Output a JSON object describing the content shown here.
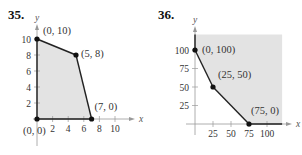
{
  "chart_data": [
    {
      "type": "area",
      "problem_number": "35.",
      "xlabel": "x",
      "ylabel": "y",
      "xlim": [
        0,
        11
      ],
      "ylim": [
        0,
        10.5
      ],
      "x_ticks": [
        2,
        4,
        6,
        8,
        10
      ],
      "y_ticks": [
        2,
        4,
        6,
        8,
        10
      ],
      "region": "bounded",
      "vertices": [
        {
          "x": 0,
          "y": 0,
          "label": "(0, 0)"
        },
        {
          "x": 0,
          "y": 10,
          "label": "(0, 10)"
        },
        {
          "x": 5,
          "y": 8,
          "label": "(5, 8)"
        },
        {
          "x": 7,
          "y": 0,
          "label": "(7, 0)"
        }
      ],
      "fill_color": "#e3e3e3",
      "line_color": "#222222"
    },
    {
      "type": "area",
      "problem_number": "36.",
      "xlabel": "x",
      "ylabel": "y",
      "xlim": [
        0,
        110
      ],
      "ylim": [
        0,
        110
      ],
      "x_ticks": [
        25,
        50,
        75,
        100
      ],
      "y_ticks": [
        25,
        50,
        75,
        100
      ],
      "region": "unbounded",
      "vertices": [
        {
          "x": 0,
          "y": 100,
          "label": "(0, 100)"
        },
        {
          "x": 25,
          "y": 50,
          "label": "(25, 50)"
        },
        {
          "x": 75,
          "y": 0,
          "label": "(75, 0)"
        }
      ],
      "fill_color": "#e3e3e3",
      "line_color": "#222222"
    }
  ]
}
